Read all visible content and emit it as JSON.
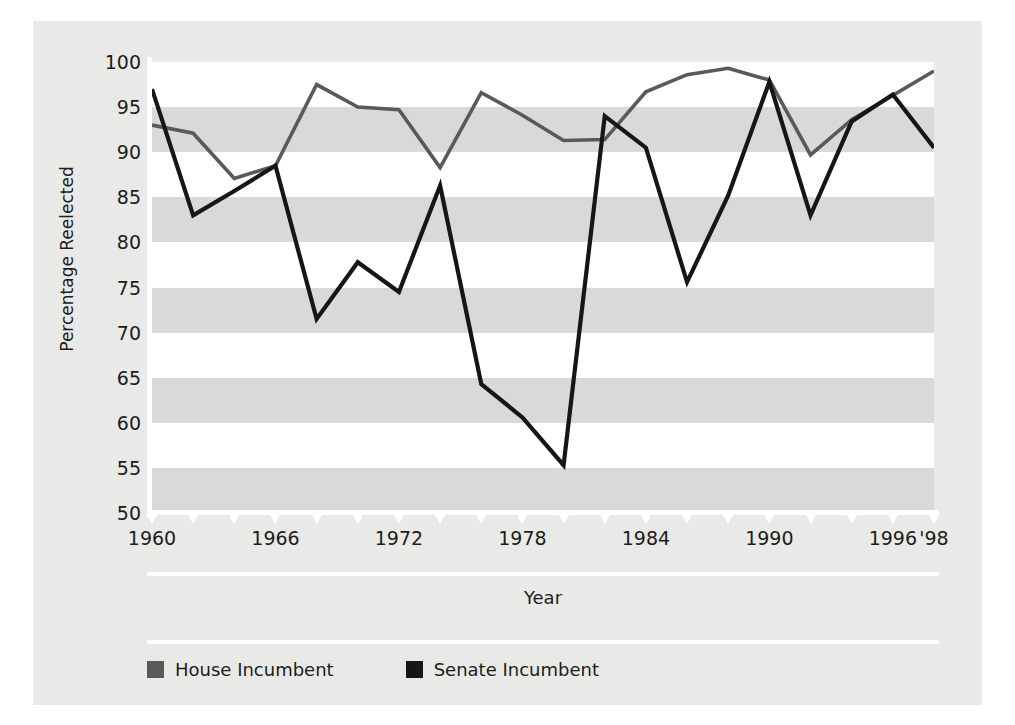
{
  "chart_data": {
    "type": "line",
    "title": "",
    "xlabel": "Year",
    "ylabel": "Percentage Reelected",
    "xlim": [
      1960,
      1998
    ],
    "ylim": [
      50,
      100
    ],
    "ytick_values": [
      100,
      95,
      90,
      85,
      80,
      75,
      70,
      65,
      60,
      55,
      50
    ],
    "ytick_labels": [
      "100",
      "95",
      "90",
      "85",
      "80",
      "75",
      "70",
      "65",
      "60",
      "55",
      "50"
    ],
    "xtick_values": [
      1960,
      1962,
      1964,
      1966,
      1968,
      1970,
      1972,
      1974,
      1976,
      1978,
      1980,
      1982,
      1984,
      1986,
      1988,
      1990,
      1992,
      1994,
      1996,
      1998
    ],
    "xtick_labels": [
      "1960",
      "",
      "",
      "1966",
      "",
      "",
      "1972",
      "",
      "",
      "1978",
      "",
      "",
      "1984",
      "",
      "",
      "1990",
      "",
      "",
      "1996",
      "'98"
    ],
    "grid": "horizontal-banded",
    "legend_position": "bottom-left",
    "x": [
      1960,
      1962,
      1964,
      1966,
      1968,
      1970,
      1972,
      1974,
      1976,
      1978,
      1980,
      1982,
      1984,
      1986,
      1988,
      1990,
      1992,
      1994,
      1996,
      1998
    ],
    "series": [
      {
        "name": "House Incumbent",
        "color": "#595959",
        "values": [
          93.0,
          92.1,
          87.1,
          88.5,
          97.5,
          95.0,
          94.7,
          88.3,
          96.6,
          94.1,
          91.3,
          91.4,
          96.7,
          98.6,
          99.3,
          98.0,
          89.7,
          93.6,
          96.3,
          99.0
        ]
      },
      {
        "name": "Senate Incumbent",
        "color": "#161616",
        "values": [
          97.0,
          83.0,
          85.7,
          88.5,
          71.5,
          77.8,
          74.5,
          86.3,
          64.3,
          60.6,
          55.3,
          94.0,
          90.5,
          75.6,
          85.2,
          97.8,
          83.0,
          93.4,
          96.4,
          90.5
        ]
      }
    ]
  },
  "legend": {
    "items": [
      {
        "label": "House Incumbent",
        "color": "#595959"
      },
      {
        "label": "Senate Incumbent",
        "color": "#161616"
      }
    ]
  }
}
